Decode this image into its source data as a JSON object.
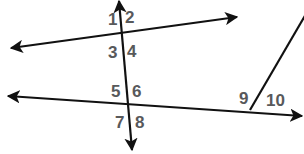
{
  "diagram": {
    "type": "parallel-lines-transversal",
    "line_color": "#111111",
    "label_color": "#58595b",
    "angle_labels": [
      {
        "id": "1",
        "text": "1",
        "x": 108,
        "y": 25
      },
      {
        "id": "2",
        "text": "2",
        "x": 125,
        "y": 23
      },
      {
        "id": "3",
        "text": "3",
        "x": 108,
        "y": 58
      },
      {
        "id": "4",
        "text": "4",
        "x": 127,
        "y": 57
      },
      {
        "id": "5",
        "text": "5",
        "x": 111,
        "y": 97
      },
      {
        "id": "6",
        "text": "6",
        "x": 132,
        "y": 97
      },
      {
        "id": "7",
        "text": "7",
        "x": 115,
        "y": 128
      },
      {
        "id": "8",
        "text": "8",
        "x": 135,
        "y": 128
      },
      {
        "id": "9",
        "text": "9",
        "x": 239,
        "y": 104
      },
      {
        "id": "10",
        "text": "10",
        "x": 266,
        "y": 106
      }
    ]
  }
}
